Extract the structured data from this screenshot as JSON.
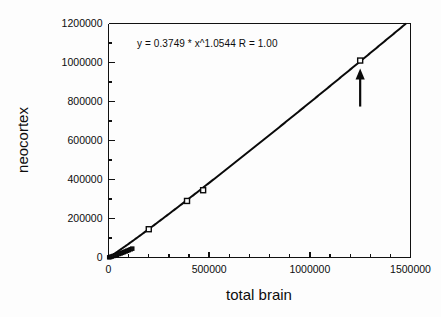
{
  "chart_data": {
    "type": "scatter",
    "title": "",
    "xlabel": "total brain",
    "ylabel": "neocortex",
    "xlim": [
      0,
      1500000
    ],
    "ylim": [
      0,
      1200000
    ],
    "grid": false,
    "legend": "none",
    "annotation": "y = 0.3749 * x^1.0544   R = 1.00",
    "fit": {
      "form": "power",
      "coefficient": 0.3749,
      "exponent": 1.0544,
      "r": 1.0,
      "label": "y = 0.3749 * x^1.0544   R = 1.00"
    },
    "x_ticks": [
      0,
      500000,
      1000000,
      1500000
    ],
    "x_tick_labels": [
      "0",
      "500000",
      "1000000",
      "1500000"
    ],
    "x_minor_step": 100000,
    "y_ticks": [
      0,
      200000,
      400000,
      600000,
      800000,
      1000000,
      1200000
    ],
    "y_tick_labels": [
      "0",
      "200000",
      "400000",
      "600000",
      "800000",
      "1000000",
      "1200000"
    ],
    "y_minor_step": 100000,
    "points": [
      {
        "x": 3500,
        "y": 1000
      },
      {
        "x": 9000,
        "y": 2600
      },
      {
        "x": 16000,
        "y": 5000
      },
      {
        "x": 24000,
        "y": 7600
      },
      {
        "x": 33000,
        "y": 10800
      },
      {
        "x": 42000,
        "y": 14000
      },
      {
        "x": 52000,
        "y": 18000
      },
      {
        "x": 60000,
        "y": 21000
      },
      {
        "x": 68000,
        "y": 24000
      },
      {
        "x": 76000,
        "y": 27500
      },
      {
        "x": 85000,
        "y": 31000
      },
      {
        "x": 93000,
        "y": 34500
      },
      {
        "x": 101000,
        "y": 38000
      },
      {
        "x": 110000,
        "y": 42000
      },
      {
        "x": 118000,
        "y": 45500
      },
      {
        "x": 200000,
        "y": 145000
      },
      {
        "x": 390000,
        "y": 290000
      },
      {
        "x": 470000,
        "y": 345000
      },
      {
        "x": 1250000,
        "y": 1010000
      }
    ],
    "highlight": {
      "x": 1250000,
      "y": 1010000,
      "marker": "arrow-up"
    }
  },
  "axes": {
    "x_title": "total brain",
    "y_title": "neocortex"
  }
}
